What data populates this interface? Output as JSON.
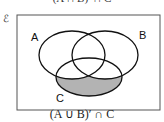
{
  "top_caption": "(A ∩ B)′ ∩ C",
  "universal_set_symbol": "ℰ",
  "sets": [
    {
      "label": "A"
    },
    {
      "label": "B"
    },
    {
      "label": "C"
    }
  ],
  "shaded_region": "(A ∪ B)′ ∩ C",
  "shade_color": "#b3b3b3",
  "caption": "(A ∪ B)′ ∩ C"
}
